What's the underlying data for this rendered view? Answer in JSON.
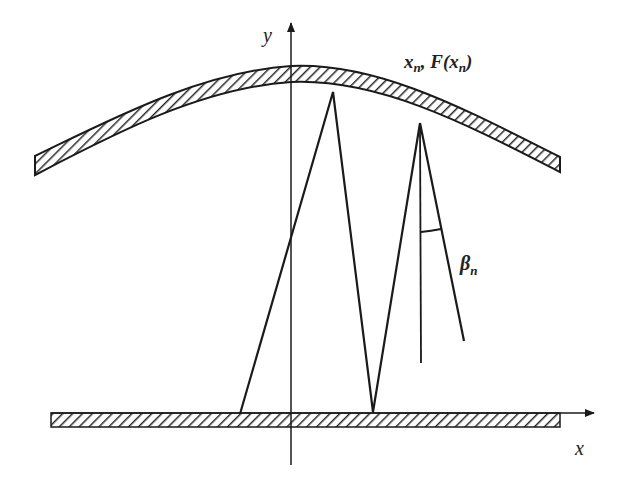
{
  "diagram": {
    "labels": {
      "y_axis": "y",
      "x_axis": "x",
      "point": "x",
      "point_sub": "n",
      "point_sep": ", F(",
      "point_arg": "x",
      "point_arg_sub": "n",
      "point_close": ")",
      "angle": "β",
      "angle_sub": "n"
    },
    "colors": {
      "stroke": "#1a1a1a",
      "hatch": "#2a2a2a",
      "background": "#ffffff"
    },
    "geometry": {
      "y_axis_x": 291,
      "x_axis_y": 413,
      "ray_path": [
        [
          240,
          414
        ],
        [
          333,
          92
        ],
        [
          373,
          412
        ],
        [
          420,
          123
        ]
      ],
      "normal_line": [
        [
          420,
          123
        ],
        [
          421,
          363
        ]
      ],
      "reflected_ray": [
        [
          420,
          123
        ],
        [
          464,
          341
        ]
      ]
    }
  }
}
